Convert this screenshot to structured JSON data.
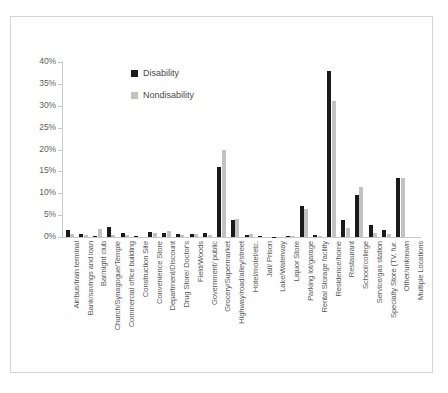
{
  "chart_data": {
    "type": "bar",
    "title": "",
    "xlabel": "",
    "ylabel": "",
    "ylim": [
      0,
      40
    ],
    "ytick_labels": [
      "40%",
      "35%",
      "30%",
      "25%",
      "20%",
      "15%",
      "10%",
      "5%",
      "0%"
    ],
    "ytick_values": [
      40,
      35,
      30,
      25,
      20,
      15,
      10,
      5,
      0
    ],
    "grid": false,
    "legend_position": "upper-left-inset",
    "categories": [
      "Air/bus/train terminal",
      "Bank/savings and loan",
      "Bar/night club",
      "Church/Synagogue/Temple",
      "Commercial office building",
      "Construction Site",
      "Convenience Store",
      "Department/Discount",
      "Drug Store/ Doctor's",
      "Field/Woods",
      "Government/ public",
      "Grocery/Supermarket",
      "Highway/road/alley/street",
      "Hotel/motel/etc.",
      "Jail/ Prison",
      "Lake/Waterway",
      "Liquor Store",
      "Parking lot/garage",
      "Rental Storage facility",
      "Residence/home",
      "Restaurant",
      "School/college",
      "Service/gas station",
      "Specialty Store (TV, fur.",
      "Other/unknown",
      "Multiple Locations"
    ],
    "series": [
      {
        "name": "Disability",
        "color": "#1a1a1a",
        "values": [
          1.6,
          0.8,
          0.3,
          2.3,
          1.0,
          0.2,
          1.1,
          0.9,
          0.6,
          0.8,
          1.0,
          16.0,
          4.0,
          0.5,
          0.3,
          0.1,
          0.2,
          7.0,
          0.4,
          38.0,
          4.0,
          9.5,
          2.7,
          1.6,
          13.5,
          0.0
        ],
        "labels": [
          "1.6%",
          "0.8%",
          "0.3%",
          "2.3%",
          "1.0%",
          "0.2%",
          "1.1%",
          "0.9%",
          "0.6%",
          "0.8%",
          "1.0%",
          "16.0%",
          "4.0%",
          "0.5%",
          "0.3%",
          "0.1%",
          "0.2%",
          "7.0%",
          "0.4%",
          "38.0%",
          "4.0%",
          "9.5%",
          "2.7%",
          "1.6%",
          "13.5%",
          "0.0%"
        ]
      },
      {
        "name": "Nondisability",
        "color": "#c2c2c2",
        "values": [
          0.6,
          0.4,
          1.8,
          0.5,
          0.4,
          0.1,
          0.9,
          1.3,
          0.4,
          0.6,
          0.5,
          19.8,
          4.2,
          0.6,
          0.1,
          0.1,
          0.3,
          6.5,
          0.3,
          31.0,
          2.0,
          11.5,
          1.0,
          0.8,
          13.6,
          0.0
        ],
        "labels": [
          "0.6%",
          "0.4%",
          "1.8%",
          "0.5%",
          "0.4%",
          "0.1%",
          "0.9%",
          "1.3%",
          "0.4%",
          "0.6%",
          "0.5%",
          "19.8%",
          "4.2%",
          "0.6%",
          "0.1%",
          "0.1%",
          "0.3%",
          "6.5%",
          "0.3%",
          "31.0%",
          "2.0%",
          "11.5%",
          "1.0%",
          "0.8%",
          "13.6%",
          "0.0%"
        ]
      }
    ]
  },
  "legend": {
    "items": [
      {
        "label": "Disability",
        "color": "#1a1a1a"
      },
      {
        "label": "Nondisability",
        "color": "#c2c2c2"
      }
    ]
  }
}
